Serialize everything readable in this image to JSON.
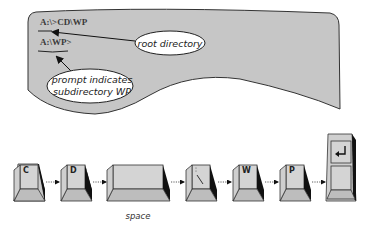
{
  "screen": {
    "panel_color": "#c8c8c8",
    "lines": [
      {
        "text": "A:\\>CD\\WP"
      },
      {
        "text": "A:\\WP>"
      }
    ]
  },
  "callouts": [
    {
      "label": "root directory"
    },
    {
      "label_line1": "prompt indicates",
      "label_line2": "subdirectory WP"
    }
  ],
  "keys": [
    {
      "label": "C"
    },
    {
      "label": "D"
    },
    {
      "label": ""
    },
    {
      "label": "\\"
    },
    {
      "label": "W"
    },
    {
      "label": "P"
    },
    {
      "label": "↵"
    }
  ],
  "space_caption": "space",
  "colors": {
    "key_top": "#d6d6d6",
    "key_front": "#c4c4c4",
    "key_shadow": "#1a1a1a",
    "outline": "#333333"
  }
}
